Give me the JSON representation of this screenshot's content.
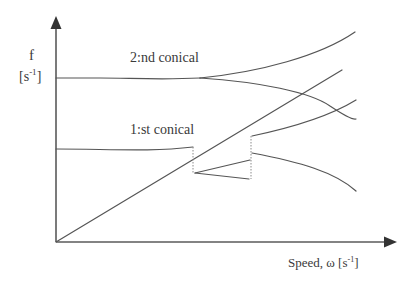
{
  "diagram": {
    "type": "campbell-diagram",
    "y_axis": {
      "symbol": "f",
      "unit_open": "[s",
      "unit_exp": "-1",
      "unit_close": "]"
    },
    "x_axis": {
      "label": "Speed, ω [s",
      "unit_exp": "-1",
      "unit_close": "]"
    },
    "modes": [
      {
        "name": "2nd-conical",
        "label": "2:nd conical"
      },
      {
        "name": "1st-conical",
        "label": "1:st conical"
      }
    ],
    "colors": {
      "line": "#555555",
      "axis": "#5a5a5a",
      "text": "#3a3a3a",
      "background": "#ffffff"
    }
  }
}
